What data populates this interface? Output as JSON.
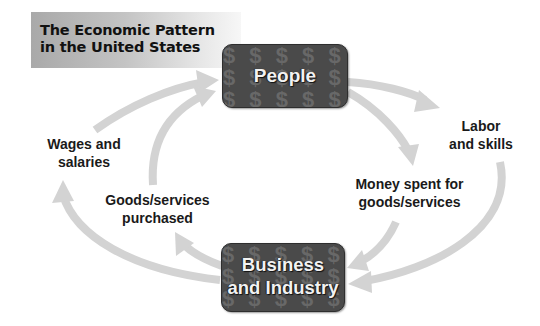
{
  "title": {
    "line1": "The Economic Pattern",
    "line2": "in the United States"
  },
  "nodes": {
    "people": {
      "label": "People",
      "pattern_glyph": "$"
    },
    "business": {
      "line1": "Business",
      "line2": "and Industry",
      "pattern_glyph": "$"
    }
  },
  "flows": {
    "wages": {
      "line1": "Wages and",
      "line2": "salaries",
      "direction": "business-to-people"
    },
    "goods_purchased": {
      "line1": "Goods/services",
      "line2": "purchased",
      "direction": "business-to-people"
    },
    "labor": {
      "line1": "Labor",
      "line2": "and skills",
      "direction": "people-to-business"
    },
    "money_spent": {
      "line1": "Money spent for",
      "line2": "goods/services",
      "direction": "people-to-business"
    }
  },
  "colors": {
    "arrow": "#d3d3d3",
    "node_fill": "#4a4a4a",
    "node_text": "#f2f2f2",
    "banner_start": "#a9a9a9",
    "banner_end": "#f7f7f7"
  },
  "pattern_text": "$ $ $ $ $ $ $ $ $ $ $ $ $ $ $ $ $ $ $ $ $ $ $ $ $ $ $ $ $ $"
}
